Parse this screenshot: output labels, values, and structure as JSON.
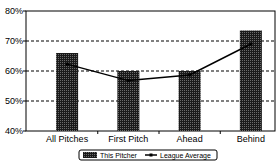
{
  "chart_data": {
    "type": "bar",
    "title": "",
    "xlabel": "",
    "ylabel": "",
    "categories": [
      "All Pitches",
      "First Pitch",
      "Ahead",
      "Behind"
    ],
    "series": [
      {
        "name": "This Pitcher",
        "kind": "bar",
        "values": [
          66,
          60,
          60,
          73.5
        ],
        "color": "#333333"
      },
      {
        "name": "League Average",
        "kind": "line",
        "values": [
          62.3,
          56.8,
          58.7,
          69
        ],
        "color": "#000000"
      }
    ],
    "ylim": [
      40,
      80
    ],
    "yticks": [
      40,
      50,
      60,
      70,
      80
    ],
    "ytick_labels": [
      "40%",
      "50%",
      "60%",
      "70%",
      "80%"
    ],
    "grid": {
      "y": true,
      "style": "dashed"
    },
    "legend": {
      "position": "bottom",
      "entries": [
        "This Pitcher",
        "League Average"
      ]
    }
  }
}
